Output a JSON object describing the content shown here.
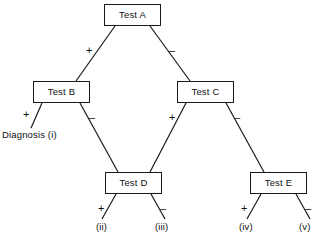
{
  "diagram": {
    "type": "decision-tree",
    "line_color": "#1a1a1a",
    "background_color": "#ffffff",
    "nodes": [
      {
        "id": "test-a",
        "label": "Test A",
        "x": 104,
        "y": 4,
        "w": 57,
        "h": 22
      },
      {
        "id": "test-b",
        "label": "Test B",
        "x": 33,
        "y": 81,
        "w": 57,
        "h": 22
      },
      {
        "id": "test-c",
        "label": "Test C",
        "x": 177,
        "y": 81,
        "w": 57,
        "h": 22
      },
      {
        "id": "test-d",
        "label": "Test D",
        "x": 105,
        "y": 172,
        "w": 57,
        "h": 22
      },
      {
        "id": "test-e",
        "label": "Test E",
        "x": 250,
        "y": 172,
        "w": 57,
        "h": 22
      }
    ],
    "edge_labels": [
      {
        "id": "a-plus",
        "text": "+",
        "x": 86,
        "y": 45
      },
      {
        "id": "a-minus",
        "text": "–",
        "x": 169,
        "y": 45
      },
      {
        "id": "b-plus",
        "text": "+",
        "x": 23,
        "y": 109
      },
      {
        "id": "b-minus",
        "text": "–",
        "x": 89,
        "y": 112
      },
      {
        "id": "c-plus",
        "text": "+",
        "x": 169,
        "y": 112
      },
      {
        "id": "c-minus",
        "text": "–",
        "x": 234,
        "y": 112
      },
      {
        "id": "d-plus",
        "text": "+",
        "x": 98,
        "y": 203
      },
      {
        "id": "d-minus",
        "text": "–",
        "x": 160,
        "y": 203
      },
      {
        "id": "e-plus",
        "text": "+",
        "x": 241,
        "y": 203
      },
      {
        "id": "e-minus",
        "text": "–",
        "x": 305,
        "y": 203
      }
    ],
    "outcomes": [
      {
        "id": "diagnosis-i",
        "text": "Diagnosis (i)",
        "x": 2,
        "y": 130
      },
      {
        "id": "outcome-ii",
        "text": "(ii)",
        "x": 96,
        "y": 222
      },
      {
        "id": "outcome-iii",
        "text": "(iii)",
        "x": 155,
        "y": 222
      },
      {
        "id": "outcome-iv",
        "text": "(iv)",
        "x": 239,
        "y": 222
      },
      {
        "id": "outcome-v",
        "text": "(v)",
        "x": 299,
        "y": 222
      }
    ],
    "edges": [
      {
        "id": "edge-a-b",
        "from": "test-a",
        "to": "test-b",
        "branch": "+",
        "x1": 115,
        "y1": 26,
        "x2": 76,
        "y2": 81
      },
      {
        "id": "edge-a-c",
        "from": "test-a",
        "to": "test-c",
        "branch": "–",
        "x1": 150,
        "y1": 26,
        "x2": 190,
        "y2": 81
      },
      {
        "id": "edge-b-i",
        "from": "test-b",
        "to": "diagnosis-i",
        "branch": "+",
        "x1": 42,
        "y1": 103,
        "x2": 31,
        "y2": 128
      },
      {
        "id": "edge-b-d",
        "from": "test-b",
        "to": "test-d",
        "branch": "–",
        "x1": 80,
        "y1": 103,
        "x2": 118,
        "y2": 172
      },
      {
        "id": "edge-c-d",
        "from": "test-c",
        "to": "test-d",
        "branch": "+",
        "x1": 186,
        "y1": 103,
        "x2": 150,
        "y2": 172
      },
      {
        "id": "edge-c-e",
        "from": "test-c",
        "to": "test-e",
        "branch": "–",
        "x1": 226,
        "y1": 103,
        "x2": 264,
        "y2": 172
      },
      {
        "id": "edge-d-ii",
        "from": "test-d",
        "to": "outcome-ii",
        "branch": "+",
        "x1": 116,
        "y1": 194,
        "x2": 102,
        "y2": 219
      },
      {
        "id": "edge-d-iii",
        "from": "test-d",
        "to": "outcome-iii",
        "branch": "–",
        "x1": 151,
        "y1": 194,
        "x2": 165,
        "y2": 219
      },
      {
        "id": "edge-e-iv",
        "from": "test-e",
        "to": "outcome-iv",
        "branch": "+",
        "x1": 261,
        "y1": 194,
        "x2": 247,
        "y2": 219
      },
      {
        "id": "edge-e-v",
        "from": "test-e",
        "to": "outcome-v",
        "branch": "–",
        "x1": 296,
        "y1": 194,
        "x2": 310,
        "y2": 219
      }
    ]
  }
}
